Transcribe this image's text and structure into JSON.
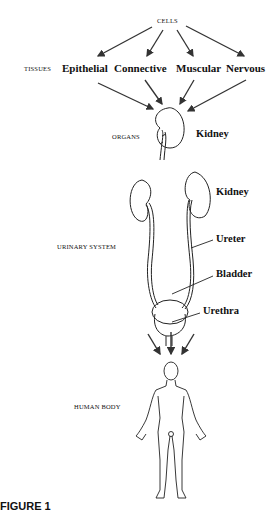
{
  "diagram": {
    "levels": {
      "cells": "CELLS",
      "tissues": "TISSUES",
      "organs": "ORGANS",
      "urinary_system": "URINARY SYSTEM",
      "human_body": "HUMAN BODY"
    },
    "tissues": [
      "Epithelial",
      "Connective",
      "Muscular",
      "Nervous"
    ],
    "organ_label": "Kidney",
    "system_labels": {
      "kidney": "Kidney",
      "ureter": "Ureter",
      "bladder": "Bladder",
      "urethra": "Urethra"
    },
    "figure_caption": "FIGURE 1"
  }
}
